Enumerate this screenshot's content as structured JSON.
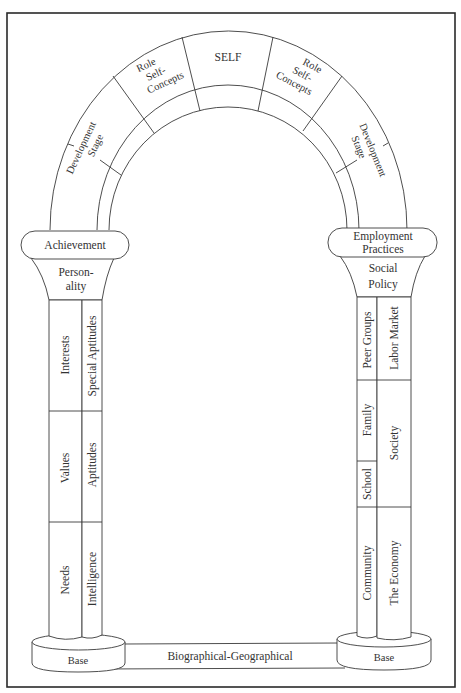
{
  "diagram": {
    "arch": {
      "keystone": "SELF",
      "left_upper": [
        "Role",
        "Self-",
        "Concepts"
      ],
      "right_upper": [
        "Role",
        "Self-",
        "Concepts"
      ],
      "left_lower": [
        "Development",
        "Stage"
      ],
      "right_lower": [
        "Development",
        "Stage"
      ]
    },
    "left_pillar": {
      "capital": "Achievement",
      "neck": [
        "Person-",
        "ality"
      ],
      "column_a": [
        "Interests",
        "Values",
        "Needs"
      ],
      "column_b": [
        "Special Aptitudes",
        "Aptitudes",
        "Intelligence"
      ],
      "base": "Base"
    },
    "right_pillar": {
      "capital": [
        "Employment",
        "Practices"
      ],
      "neck": [
        "Social",
        "Policy"
      ],
      "column_a": [
        "Peer Groups",
        "Family",
        "School",
        "Community"
      ],
      "column_b": [
        "Labor Market",
        "Society",
        "The Economy"
      ],
      "base": "Base"
    },
    "foundation": "Biographical-Geographical",
    "colors": {
      "line": "#3a3a3a",
      "frame": "#2a2a2a",
      "text": "#333333",
      "background": "#ffffff"
    }
  }
}
